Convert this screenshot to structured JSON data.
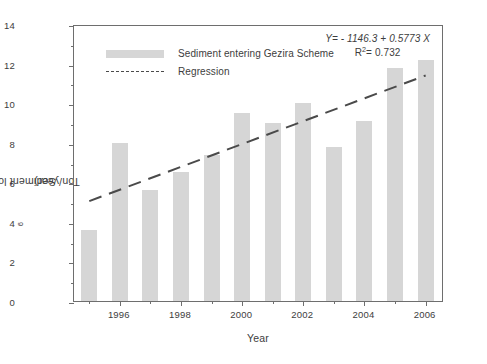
{
  "chart_data": {
    "type": "bar",
    "title": "",
    "xlabel": "Year",
    "ylabel": "Sediment load (10^6 Ton/year)",
    "ylabel_parts": {
      "pre": "Sediment load (10",
      "sup": "6",
      "post": " Ton/year)"
    },
    "categories": [
      1995,
      1996,
      1997,
      1998,
      1999,
      2000,
      2001,
      2002,
      2003,
      2004,
      2005,
      2006
    ],
    "values": [
      3.6,
      8.0,
      5.6,
      6.5,
      7.4,
      9.5,
      9.0,
      10.0,
      7.8,
      9.1,
      11.8,
      12.2
    ],
    "series": [
      {
        "name": "Sediment entering Gezira Scheme",
        "type": "bar",
        "values": [
          3.6,
          8.0,
          5.6,
          6.5,
          7.4,
          9.5,
          9.0,
          10.0,
          7.8,
          9.1,
          11.8,
          12.2
        ]
      },
      {
        "name": "Regression",
        "type": "line",
        "style": "dashed",
        "endpoints": [
          {
            "x": 1995,
            "y": 5.15
          },
          {
            "x": 2006,
            "y": 11.5
          }
        ]
      }
    ],
    "xlim": [
      1994.5,
      2006.6
    ],
    "ylim": [
      0,
      14
    ],
    "yticks": [
      0,
      2,
      4,
      6,
      8,
      10,
      12,
      14
    ],
    "ytick_labels": [
      "0",
      "2",
      "4",
      "6",
      "8",
      "10",
      "12",
      "14"
    ],
    "ytick_minor": [
      1,
      3,
      5,
      7,
      9,
      11,
      13
    ],
    "xticks": [
      1996,
      1998,
      2000,
      2002,
      2004,
      2006
    ],
    "xtick_labels": [
      "1996",
      "1998",
      "2000",
      "2002",
      "2004",
      "2006"
    ],
    "xtick_minor": [
      1995,
      1997,
      1999,
      2001,
      2003,
      2005
    ],
    "grid": false,
    "legend_position": "upper-left",
    "bar_color": "#d6d6d6",
    "line_color": "#4a4a4a",
    "axis_color": "#6e6e6e"
  },
  "legend": {
    "items": [
      {
        "label": "Sediment entering Gezira Scheme",
        "marker": "bar-swatch"
      },
      {
        "label": "Regression",
        "marker": "dashed-line-swatch"
      }
    ]
  },
  "annotation": {
    "equation": "Y= - 1146.3 + 0.5773 X",
    "r_squared_prefix": "R",
    "r_squared_sup": "2",
    "r_squared_value": "= 0.732"
  }
}
